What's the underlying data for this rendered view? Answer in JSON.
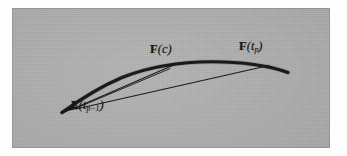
{
  "figure": {
    "kind": "mathematical-diagram",
    "plate_color": "#a9a9a9",
    "ink_color": "#141414",
    "page_background": "#fdfdfd"
  },
  "labels": {
    "mid_point": {
      "function": "F",
      "open": "(",
      "argument": "c",
      "close": ")",
      "plain": "F(c)"
    },
    "end_point": {
      "function": "F",
      "open": "(",
      "argument": "t",
      "subscript": "p",
      "close": ")",
      "plain": "F(t_p)"
    },
    "start_point": {
      "function": "F",
      "open": "(",
      "argument": "t",
      "subscript": "p−1",
      "close": ")",
      "plain": "F(t_p-1)"
    }
  },
  "chart_data": {
    "type": "line",
    "title": "",
    "xlabel": "",
    "ylabel": "",
    "grid": false,
    "legend": "none",
    "xlim": [
      12,
      330
    ],
    "ylim": [
      8,
      148
    ],
    "series": [
      {
        "name": "curve-F",
        "style": "thick-arc",
        "linewidth": 3.2,
        "points": [
          [
            62,
            112
          ],
          [
            72,
            103
          ],
          [
            88,
            92
          ],
          [
            108,
            81
          ],
          [
            132,
            72
          ],
          [
            158,
            66
          ],
          [
            182,
            63
          ],
          [
            208,
            62
          ],
          [
            234,
            63
          ],
          [
            258,
            66
          ],
          [
            278,
            70
          ],
          [
            288,
            73
          ]
        ]
      },
      {
        "name": "chord-to-mid",
        "style": "thin-straight",
        "linewidth": 1.0,
        "points": [
          [
            76,
            107
          ],
          [
            176,
            64
          ]
        ]
      },
      {
        "name": "chord-to-end",
        "style": "thin-straight",
        "linewidth": 1.0,
        "points": [
          [
            76,
            108
          ],
          [
            268,
            66
          ]
        ]
      },
      {
        "name": "chord-inner-short",
        "style": "thin-straight",
        "linewidth": 0.9,
        "points": [
          [
            76,
            107
          ],
          [
            168,
            70
          ]
        ]
      }
    ],
    "markers": [
      {
        "name": "F(t_p-1)",
        "x": 76,
        "y": 108
      },
      {
        "name": "F(c)",
        "x": 176,
        "y": 64
      },
      {
        "name": "F(t_p)",
        "x": 268,
        "y": 66
      }
    ]
  }
}
